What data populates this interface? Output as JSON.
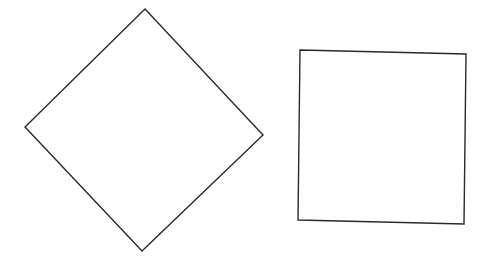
{
  "canvas": {
    "width": 481,
    "height": 262,
    "background": "#ffffff"
  },
  "stroke": {
    "color": "#2a2a2a",
    "width": 1.4
  },
  "shapes": [
    {
      "name": "diamond",
      "type": "polygon",
      "description": "Square rotated ~45 degrees",
      "points": "145,9 263,135 142,251 25,127"
    },
    {
      "name": "square",
      "type": "polygon",
      "description": "Square, slightly tilted",
      "points": "300,50 466,54 464,224 298,220"
    }
  ]
}
